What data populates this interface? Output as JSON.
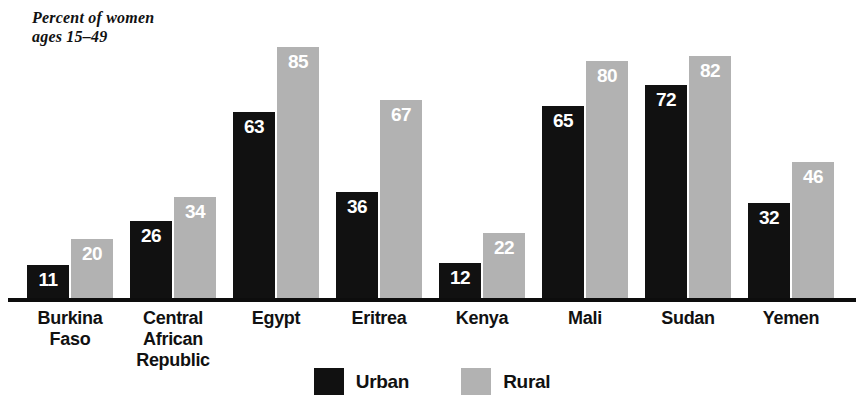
{
  "chart_data": {
    "type": "bar",
    "title": "Percent of women\nages 15–49",
    "xlabel": "",
    "ylabel": "",
    "ylim": [
      0,
      92
    ],
    "grid": false,
    "legend_position": "bottom-center",
    "categories": [
      "Burkina\nFaso",
      "Central\nAfrican\nRepublic",
      "Egypt",
      "Eritrea",
      "Kenya",
      "Mali",
      "Sudan",
      "Yemen"
    ],
    "series": [
      {
        "name": "Urban",
        "color": "#111111",
        "values": [
          11,
          26,
          63,
          36,
          12,
          65,
          72,
          32
        ]
      },
      {
        "name": "Rural",
        "color": "#b2b2b2",
        "values": [
          20,
          34,
          85,
          67,
          22,
          80,
          82,
          46
        ]
      }
    ]
  },
  "legend": {
    "items": [
      {
        "label": "Urban",
        "color": "#111111"
      },
      {
        "label": "Rural",
        "color": "#b2b2b2"
      }
    ]
  },
  "colors": {
    "urban": "#111111",
    "rural": "#b2b2b2",
    "axis": "#0d0d0d",
    "text": "#111111",
    "value_text": "#ffffff",
    "background": "#ffffff"
  }
}
